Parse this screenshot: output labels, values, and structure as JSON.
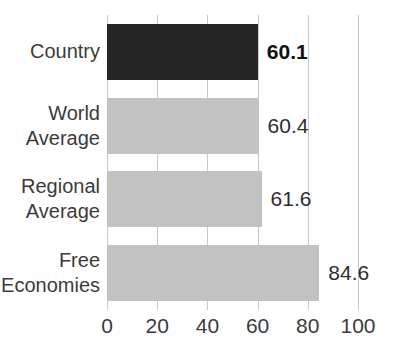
{
  "chart_data": {
    "type": "bar",
    "orientation": "horizontal",
    "title": "",
    "subtitle": "",
    "xlabel": "",
    "ylabel": "",
    "categories": [
      "Country",
      "World\nAverage",
      "Regional\nAverage",
      "Free\nEconomies"
    ],
    "values": [
      60.1,
      60.4,
      61.6,
      84.6
    ],
    "value_labels": [
      "60.1",
      "60.4",
      "61.6",
      "84.6"
    ],
    "highlight_index": 0,
    "xlim": [
      0,
      100
    ],
    "xticks": [
      0,
      20,
      40,
      60,
      80,
      100
    ],
    "xtick_labels": [
      "0",
      "20",
      "40",
      "60",
      "80",
      "100"
    ],
    "grid": true,
    "grid_axis": "x",
    "legend": null,
    "colors": {
      "highlight_bar": "#262626",
      "bar": "#c2c2c2",
      "gridline": "#c9c9c9",
      "text": "#3b3b3b",
      "value_text": "#2e2e2e",
      "background": "#ffffff"
    },
    "series": [
      {
        "name": "Score",
        "values": [
          60.1,
          60.4,
          61.6,
          84.6
        ]
      }
    ]
  }
}
